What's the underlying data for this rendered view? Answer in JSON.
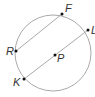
{
  "diagram": {
    "circle": {
      "cx": 53,
      "cy": 53,
      "r": 38,
      "stroke": "#aaaaaa"
    },
    "chord": {
      "from": "R",
      "to": "F"
    },
    "diameter": {
      "from": "K",
      "to": "L"
    },
    "points": {
      "F": {
        "label": "F",
        "x": 62,
        "y": 14
      },
      "L": {
        "label": "L",
        "x": 88,
        "y": 30
      },
      "R": {
        "label": "R",
        "x": 16,
        "y": 51
      },
      "P": {
        "label": "P",
        "x": 55,
        "y": 55
      },
      "K": {
        "label": "K",
        "x": 24,
        "y": 79
      }
    }
  }
}
